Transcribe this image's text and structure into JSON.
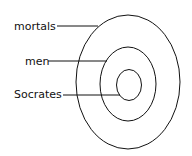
{
  "diagram": {
    "type": "nested-sets",
    "sets": [
      {
        "label": "mortals",
        "cx": 128,
        "cy": 82,
        "rx": 52,
        "ry": 67,
        "label_x": 14,
        "label_y": 30,
        "line_x1": 57,
        "line_x2": 98,
        "line_y": 26
      },
      {
        "label": "men",
        "cx": 128,
        "cy": 84,
        "rx": 28,
        "ry": 37,
        "label_x": 25,
        "label_y": 65,
        "line_x1": 48,
        "line_x2": 107,
        "line_y": 61
      },
      {
        "label": "Socrates",
        "cx": 129,
        "cy": 85,
        "rx": 12.5,
        "ry": 15.5,
        "label_x": 14,
        "label_y": 98,
        "line_x1": 63,
        "line_x2": 120,
        "line_y": 95
      }
    ],
    "stroke_color": "#111111"
  }
}
